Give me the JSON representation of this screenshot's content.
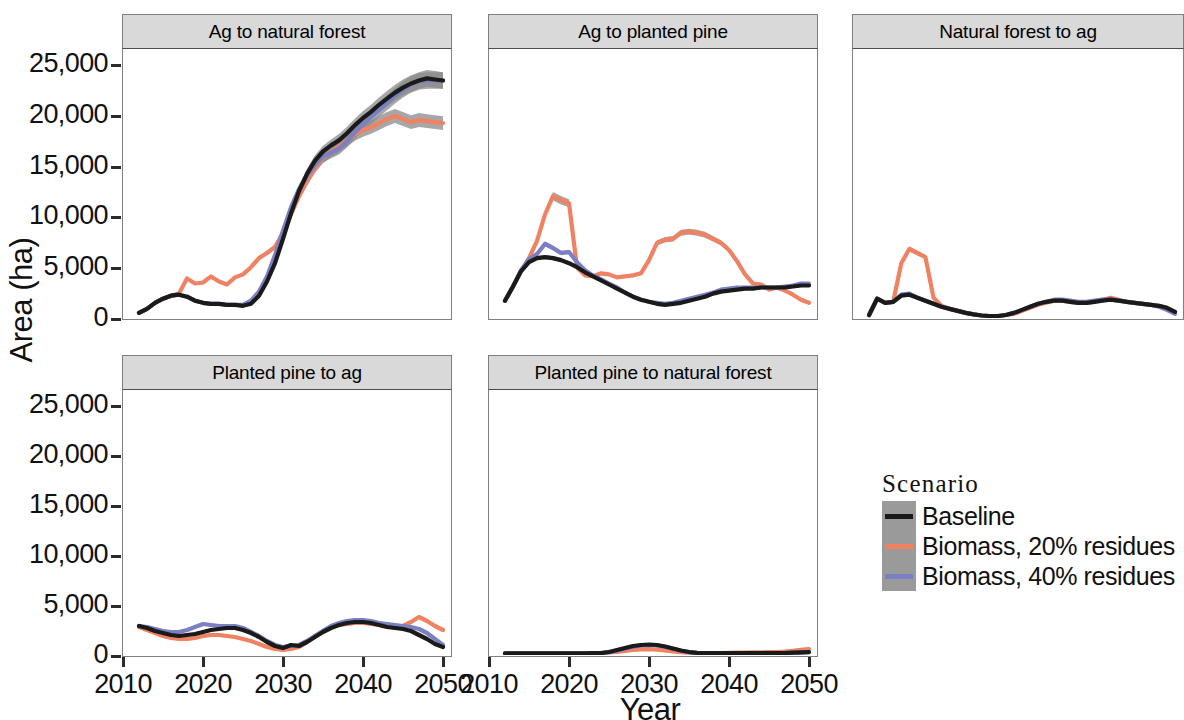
{
  "chart_data": {
    "type": "line",
    "title": "",
    "xlabel": "Year",
    "ylabel": "Area (ha)",
    "xlim": [
      2010,
      2051
    ],
    "ylim": [
      0,
      26500
    ],
    "grid": false,
    "legend_position": "right-middle",
    "legend_title": "Scenario",
    "x_ticks": [
      "2010",
      "2020",
      "2030",
      "2040",
      "2050"
    ],
    "x_tick_values": [
      2010,
      2020,
      2030,
      2040,
      2050
    ],
    "y_ticks": [
      "0",
      "5,000",
      "10,000",
      "15,000",
      "20,000",
      "25,000"
    ],
    "y_tick_values": [
      0,
      5000,
      10000,
      15000,
      20000,
      25000
    ],
    "series_colors": {
      "Baseline": "#1a1a1a",
      "Biomass, 20% residues": "#ef8262",
      "Biomass, 40% residues": "#7b7fc4"
    },
    "ribbon_color": "#8a8a8a",
    "facets": [
      {
        "name": "Ag to natural forest",
        "x": [
          2012,
          2013,
          2014,
          2015,
          2016,
          2017,
          2018,
          2019,
          2020,
          2021,
          2022,
          2023,
          2024,
          2025,
          2026,
          2027,
          2028,
          2029,
          2030,
          2031,
          2032,
          2033,
          2034,
          2035,
          2036,
          2037,
          2038,
          2039,
          2040,
          2041,
          2042,
          2043,
          2044,
          2045,
          2046,
          2047,
          2048,
          2049,
          2050
        ],
        "series": [
          {
            "name": "Baseline",
            "values": [
              500,
              900,
              1500,
              1900,
              2200,
              2300,
              2100,
              1700,
              1500,
              1400,
              1400,
              1300,
              1300,
              1200,
              1400,
              2200,
              3600,
              5400,
              7800,
              10300,
              12500,
              14200,
              15500,
              16400,
              17000,
              17500,
              18200,
              19000,
              19700,
              20300,
              21000,
              21600,
              22200,
              22700,
              23100,
              23400,
              23600,
              23500,
              23400
            ]
          },
          {
            "name": "Biomass, 20% residues",
            "values": [
              500,
              900,
              1500,
              1900,
              2200,
              2400,
              3900,
              3400,
              3500,
              4100,
              3600,
              3300,
              4000,
              4300,
              5000,
              5900,
              6400,
              7000,
              8400,
              10200,
              12000,
              13500,
              14800,
              15800,
              16400,
              16900,
              17500,
              18100,
              18500,
              18800,
              19200,
              19600,
              19900,
              19600,
              19300,
              19500,
              19400,
              19300,
              19200
            ]
          },
          {
            "name": "Biomass, 40% residues",
            "values": [
              500,
              900,
              1500,
              1900,
              2200,
              2300,
              2100,
              1700,
              1500,
              1400,
              1400,
              1300,
              1300,
              1300,
              1700,
              2600,
              4100,
              6200,
              8600,
              10900,
              12700,
              14000,
              15100,
              15900,
              16300,
              16700,
              17400,
              18300,
              19100,
              19800,
              20500,
              21200,
              21900,
              22500,
              23000,
              23300,
              23400,
              23400,
              23400
            ]
          }
        ]
      },
      {
        "name": "Ag to planted pine",
        "x": [
          2012,
          2013,
          2014,
          2015,
          2016,
          2017,
          2018,
          2019,
          2020,
          2021,
          2022,
          2023,
          2024,
          2025,
          2026,
          2027,
          2028,
          2029,
          2030,
          2031,
          2032,
          2033,
          2034,
          2035,
          2036,
          2037,
          2038,
          2039,
          2040,
          2041,
          2042,
          2043,
          2044,
          2045,
          2046,
          2047,
          2048,
          2049,
          2050
        ],
        "series": [
          {
            "name": "Baseline",
            "values": [
              1700,
              3100,
              4600,
              5500,
              5900,
              6000,
              5900,
              5700,
              5400,
              5000,
              4500,
              4100,
              3700,
              3300,
              2900,
              2500,
              2100,
              1800,
              1600,
              1400,
              1300,
              1400,
              1500,
              1700,
              1900,
              2100,
              2400,
              2600,
              2700,
              2800,
              2900,
              2900,
              3000,
              3000,
              3000,
              3000,
              3100,
              3200,
              3200
            ]
          },
          {
            "name": "Biomass, 20% residues",
            "values": [
              1700,
              3100,
              4600,
              5900,
              7600,
              10200,
              12000,
              11600,
              11300,
              5000,
              4200,
              4100,
              4400,
              4300,
              4000,
              4100,
              4200,
              4400,
              5700,
              7400,
              7700,
              7800,
              8400,
              8500,
              8400,
              8200,
              7800,
              7400,
              6700,
              5600,
              4300,
              3400,
              3300,
              2800,
              3000,
              2700,
              2300,
              1800,
              1500
            ]
          },
          {
            "name": "Biomass, 40% residues",
            "values": [
              1700,
              3100,
              4700,
              5800,
              6300,
              7300,
              6900,
              6400,
              6500,
              5500,
              4700,
              4200,
              3800,
              3400,
              3000,
              2500,
              2100,
              1800,
              1600,
              1500,
              1400,
              1500,
              1700,
              1900,
              2100,
              2300,
              2500,
              2800,
              2900,
              3000,
              3000,
              3000,
              3000,
              3000,
              3000,
              3100,
              3200,
              3400,
              3400
            ]
          }
        ]
      },
      {
        "name": "Natural forest to ag",
        "x": [
          2012,
          2013,
          2014,
          2015,
          2016,
          2017,
          2018,
          2019,
          2020,
          2021,
          2022,
          2023,
          2024,
          2025,
          2026,
          2027,
          2028,
          2029,
          2030,
          2031,
          2032,
          2033,
          2034,
          2035,
          2036,
          2037,
          2038,
          2039,
          2040,
          2041,
          2042,
          2043,
          2044,
          2045,
          2046,
          2047,
          2048,
          2049,
          2050
        ],
        "series": [
          {
            "name": "Baseline",
            "values": [
              300,
              1900,
              1500,
              1600,
              2200,
              2300,
              2000,
              1700,
              1400,
              1100,
              900,
              700,
              500,
              350,
              250,
              200,
              200,
              300,
              500,
              800,
              1100,
              1400,
              1600,
              1700,
              1700,
              1600,
              1500,
              1500,
              1600,
              1700,
              1800,
              1700,
              1600,
              1500,
              1400,
              1300,
              1200,
              1000,
              600
            ]
          },
          {
            "name": "Biomass, 20% residues",
            "values": [
              300,
              1900,
              1500,
              1600,
              5400,
              6800,
              6400,
              6000,
              2000,
              1200,
              900,
              700,
              500,
              350,
              250,
              200,
              200,
              300,
              400,
              700,
              1000,
              1300,
              1500,
              1700,
              1700,
              1600,
              1500,
              1500,
              1600,
              1800,
              2000,
              1800,
              1600,
              1500,
              1400,
              1300,
              1200,
              1000,
              600
            ]
          },
          {
            "name": "Biomass, 40% residues",
            "values": [
              300,
              1900,
              1500,
              1600,
              2300,
              2400,
              2000,
              1700,
              1400,
              1100,
              900,
              700,
              500,
              350,
              250,
              200,
              200,
              300,
              500,
              800,
              1100,
              1400,
              1600,
              1800,
              1800,
              1700,
              1600,
              1600,
              1700,
              1800,
              1800,
              1700,
              1600,
              1500,
              1400,
              1300,
              1100,
              800,
              400
            ]
          }
        ]
      },
      {
        "name": "Planted pine to ag",
        "x": [
          2012,
          2013,
          2014,
          2015,
          2016,
          2017,
          2018,
          2019,
          2020,
          2021,
          2022,
          2023,
          2024,
          2025,
          2026,
          2027,
          2028,
          2029,
          2030,
          2031,
          2032,
          2033,
          2034,
          2035,
          2036,
          2037,
          2038,
          2039,
          2040,
          2041,
          2042,
          2043,
          2044,
          2045,
          2046,
          2047,
          2048,
          2049,
          2050
        ],
        "series": [
          {
            "name": "Baseline",
            "values": [
              2900,
              2700,
              2400,
              2200,
              2000,
              1900,
              2000,
              2100,
              2300,
              2500,
              2600,
              2700,
              2700,
              2500,
              2200,
              1800,
              1300,
              900,
              700,
              1000,
              900,
              1300,
              1800,
              2300,
              2700,
              3000,
              3200,
              3300,
              3300,
              3200,
              3000,
              2800,
              2700,
              2600,
              2400,
              2000,
              1600,
              1100,
              800
            ]
          },
          {
            "name": "Biomass, 20% residues",
            "values": [
              2800,
              2500,
              2200,
              1900,
              1700,
              1600,
              1600,
              1700,
              1900,
              2000,
              2000,
              1900,
              1800,
              1600,
              1400,
              1100,
              800,
              600,
              500,
              600,
              800,
              1300,
              1900,
              2400,
              2800,
              3000,
              3100,
              3200,
              3200,
              3100,
              3000,
              2900,
              2800,
              2900,
              3300,
              3800,
              3400,
              2900,
              2500
            ]
          },
          {
            "name": "Biomass, 40% residues",
            "values": [
              2900,
              2800,
              2600,
              2400,
              2300,
              2300,
              2500,
              2800,
              3100,
              3000,
              2900,
              2900,
              2900,
              2700,
              2300,
              1900,
              1400,
              1000,
              800,
              900,
              1000,
              1400,
              1900,
              2400,
              2900,
              3200,
              3400,
              3500,
              3500,
              3400,
              3200,
              3100,
              3000,
              2900,
              2800,
              2600,
              2200,
              1600,
              1000
            ]
          }
        ]
      },
      {
        "name": "Planted pine to natural forest",
        "x": [
          2012,
          2013,
          2014,
          2015,
          2016,
          2017,
          2018,
          2019,
          2020,
          2021,
          2022,
          2023,
          2024,
          2025,
          2026,
          2027,
          2028,
          2029,
          2030,
          2031,
          2032,
          2033,
          2034,
          2035,
          2036,
          2037,
          2038,
          2039,
          2040,
          2041,
          2042,
          2043,
          2044,
          2045,
          2046,
          2047,
          2048,
          2049,
          2050
        ],
        "series": [
          {
            "name": "Baseline",
            "values": [
              170,
              170,
              170,
              170,
              170,
              170,
              170,
              170,
              170,
              170,
              170,
              180,
              200,
              300,
              500,
              700,
              900,
              1000,
              1050,
              1000,
              850,
              650,
              450,
              300,
              220,
              190,
              180,
              180,
              180,
              180,
              180,
              180,
              180,
              180,
              180,
              200,
              230,
              270,
              300
            ]
          },
          {
            "name": "Biomass, 20% residues",
            "values": [
              170,
              170,
              170,
              170,
              170,
              170,
              170,
              170,
              170,
              170,
              170,
              180,
              200,
              250,
              320,
              400,
              500,
              560,
              580,
              540,
              450,
              360,
              280,
              230,
              200,
              190,
              190,
              200,
              220,
              240,
              250,
              260,
              270,
              280,
              300,
              340,
              420,
              520,
              600
            ]
          },
          {
            "name": "Biomass, 40% residues",
            "values": [
              170,
              170,
              170,
              170,
              170,
              170,
              170,
              170,
              170,
              170,
              170,
              180,
              200,
              280,
              450,
              650,
              830,
              950,
              1000,
              960,
              820,
              620,
              430,
              290,
              215,
              185,
              180,
              180,
              180,
              180,
              180,
              180,
              180,
              180,
              180,
              190,
              210,
              240,
              270
            ]
          }
        ]
      }
    ]
  },
  "axes": {
    "y_label": "Area (ha)",
    "x_label": "Year",
    "y_ticks": [
      "25,000",
      "20,000",
      "15,000",
      "10,000",
      "5,000",
      "0"
    ],
    "x_ticks": [
      "2010",
      "2020",
      "2030",
      "2040",
      "2050"
    ]
  },
  "panels": [
    {
      "title": "Ag to natural forest"
    },
    {
      "title": "Ag to planted pine"
    },
    {
      "title": "Natural forest to ag"
    },
    {
      "title": "Planted pine to ag"
    },
    {
      "title": "Planted pine to natural forest"
    }
  ],
  "legend": {
    "title": "Scenario",
    "items": [
      {
        "label": "Baseline",
        "color": "#1a1a1a"
      },
      {
        "label": "Biomass, 20% residues",
        "color": "#ef8262"
      },
      {
        "label": "Biomass, 40% residues",
        "color": "#7b7fc4"
      }
    ]
  }
}
